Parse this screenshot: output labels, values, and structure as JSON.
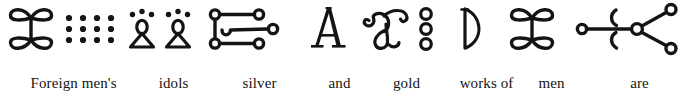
{
  "figure": {
    "type": "interlinear-gloss",
    "script_direction": "left-to-right",
    "ink_color": "#141414",
    "background_color": "#ffffff",
    "full_gloss": "Foreign men's idols silver and gold works of men are created",
    "units": [
      {
        "id": "unit-1",
        "gloss": "Foreign men's",
        "gloss_line2": "",
        "glyph_name": "double-bowtie-with-dot-grid",
        "glyph_description": "four-lobed bowtie knot followed by a 4-column by 3-row grid of dots"
      },
      {
        "id": "unit-2",
        "gloss": "idols",
        "gloss_line2": "",
        "glyph_name": "two-triangle-figures-with-dots",
        "glyph_description": "two triangular standing figures, each with a looped head and three dots above"
      },
      {
        "id": "unit-3",
        "gloss": "silver",
        "gloss_line2": "",
        "glyph_name": "ladder-with-circle-terminals",
        "glyph_description": "two stacked circles joined by a vertical bar with three horizontal arms ending in circles and a central hook"
      },
      {
        "id": "unit-4",
        "gloss": "and",
        "gloss_line2": "",
        "glyph_name": "letter-a-serif",
        "glyph_description": "serif capital letter A"
      },
      {
        "id": "unit-5",
        "gloss": "gold",
        "gloss_line2": "",
        "glyph_name": "curled-scroll-with-three-circles",
        "glyph_description": "double-curled scroll form beside a vertical column of three small circles"
      },
      {
        "id": "unit-6",
        "gloss": "works of",
        "gloss_line2": "",
        "glyph_name": "half-moon-d",
        "glyph_description": "vertical stroke closed by a rightward arc, resembling the letter D"
      },
      {
        "id": "unit-7",
        "gloss": "men",
        "gloss_line2": "",
        "glyph_name": "double-bowtie",
        "glyph_description": "four-lobed bowtie knot"
      },
      {
        "id": "unit-8",
        "gloss": "are",
        "gloss_line2": "created",
        "glyph_name": "three-pronged-node-with-brackets",
        "glyph_description": "central node linked to three circle terminals with two crescent brackets at left"
      }
    ]
  }
}
